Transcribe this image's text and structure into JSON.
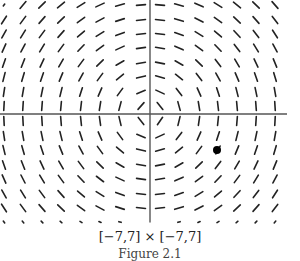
{
  "figure": {
    "domain_label": "[−7,7] × [−7,7]",
    "caption_partial": "Figure 2.1",
    "field": "slope field dy/dx = -x/y",
    "columns_x_px": [
      4,
      23,
      42,
      61,
      81,
      100,
      120,
      141,
      160,
      179,
      199,
      218,
      237,
      256,
      275
    ],
    "rows_y_px": [
      5,
      20,
      34,
      48,
      63,
      77,
      92,
      106,
      121,
      136,
      150,
      165,
      179,
      194,
      208,
      222
    ],
    "axis": {
      "vertical_x_px": 150,
      "horizontal_y_px": 114,
      "color": "#555555"
    },
    "marker": {
      "x_px": 217,
      "y_px": 150,
      "r_px": 4,
      "color": "#000000"
    },
    "segment_color": "#222222"
  }
}
